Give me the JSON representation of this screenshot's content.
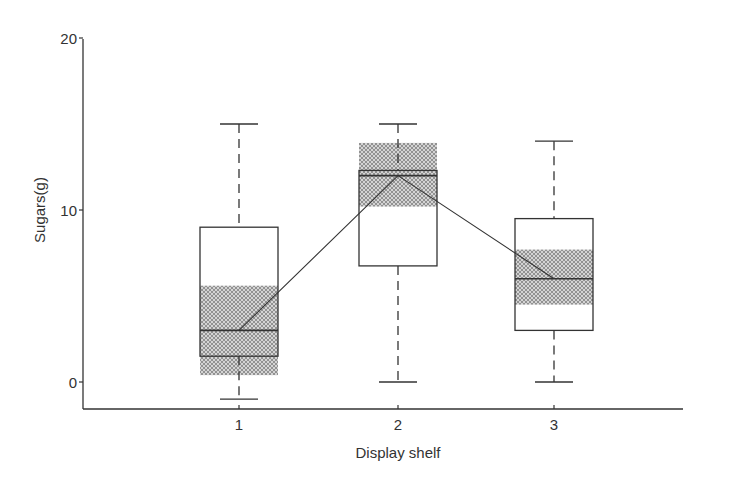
{
  "chart_data": {
    "type": "boxplot",
    "title": "",
    "xlabel": "Display shelf",
    "ylabel": "Sugars(g)",
    "ylim": [
      -1.6,
      20
    ],
    "yticks": [
      0,
      10,
      20
    ],
    "categories": [
      "1",
      "2",
      "3"
    ],
    "boxes": [
      {
        "category": "1",
        "whisker_low": -1,
        "q1": 1.5,
        "median": 3,
        "q3": 9,
        "whisker_high": 15,
        "notch_low": 0.4,
        "notch_high": 5.6
      },
      {
        "category": "2",
        "whisker_low": 0,
        "q1": 6.75,
        "median": 12,
        "q3": 12.3,
        "whisker_high": 15,
        "notch_low": 10.2,
        "notch_high": 13.9
      },
      {
        "category": "3",
        "whisker_low": 0,
        "q1": 3,
        "median": 6,
        "q3": 9.5,
        "whisker_high": 14,
        "notch_low": 4.5,
        "notch_high": 7.7
      }
    ],
    "median_line": true,
    "grid": false,
    "legend": null
  },
  "colors": {
    "axis": "#333333",
    "box_stroke": "#333333",
    "hatch_fill": "#999999",
    "background": "#ffffff"
  }
}
